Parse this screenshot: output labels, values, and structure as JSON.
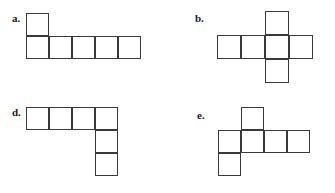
{
  "page": {
    "width": 335,
    "height": 193,
    "background_color": "#ffffff",
    "line_color": "#3a3a3a",
    "label_color": "#1a1a1a"
  },
  "figures": [
    {
      "id": "figure-a",
      "label": "a.",
      "label_x": 12,
      "label_y": 13,
      "origin_x": 26,
      "origin_y": 13,
      "cell": 23,
      "description": "one square on top-left with a row of five squares beneath",
      "cells": [
        {
          "col": 0,
          "row": 0
        },
        {
          "col": 0,
          "row": 1
        },
        {
          "col": 1,
          "row": 1
        },
        {
          "col": 2,
          "row": 1
        },
        {
          "col": 3,
          "row": 1
        },
        {
          "col": 4,
          "row": 1
        }
      ]
    },
    {
      "id": "figure-b",
      "label": "b.",
      "label_x": 195,
      "label_y": 13,
      "origin_x": 217,
      "origin_y": 11,
      "cell": 24,
      "description": "cross shape, row of four squares with one above and one below the third square",
      "cells": [
        {
          "col": 2,
          "row": 0
        },
        {
          "col": 0,
          "row": 1
        },
        {
          "col": 1,
          "row": 1
        },
        {
          "col": 2,
          "row": 1
        },
        {
          "col": 3,
          "row": 1
        },
        {
          "col": 2,
          "row": 2
        }
      ]
    },
    {
      "id": "figure-d",
      "label": "d.",
      "label_x": 12,
      "label_y": 107,
      "origin_x": 26,
      "origin_y": 107,
      "cell": 23,
      "description": "row of four squares with two squares descending below the fourth square",
      "cells": [
        {
          "col": 0,
          "row": 0
        },
        {
          "col": 1,
          "row": 0
        },
        {
          "col": 2,
          "row": 0
        },
        {
          "col": 3,
          "row": 0
        },
        {
          "col": 3,
          "row": 1
        },
        {
          "col": 3,
          "row": 2
        }
      ]
    },
    {
      "id": "figure-e",
      "label": "e.",
      "label_x": 197,
      "label_y": 110,
      "origin_x": 218,
      "origin_y": 107,
      "cell": 23,
      "description": "row of four squares with one above the second square and one below the first square",
      "cells": [
        {
          "col": 1,
          "row": 0
        },
        {
          "col": 0,
          "row": 1
        },
        {
          "col": 1,
          "row": 1
        },
        {
          "col": 2,
          "row": 1
        },
        {
          "col": 3,
          "row": 1
        },
        {
          "col": 0,
          "row": 2
        }
      ]
    }
  ]
}
